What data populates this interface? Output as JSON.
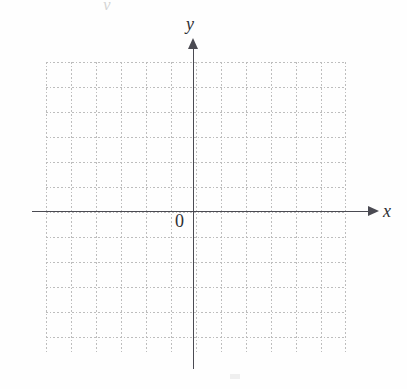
{
  "figure": {
    "type": "coordinate-grid",
    "background_color": "#fefefe",
    "axis_color": "#4a4a52",
    "grid_color": "#bdbdbd",
    "label_color": "#2e2e33"
  },
  "axes": {
    "x_label": "x",
    "y_label": "y",
    "origin_label": "0",
    "x_axis_name": "horizontal-axis",
    "y_axis_name": "vertical-axis",
    "x_arrow_direction": "right",
    "y_arrow_direction": "up"
  },
  "chart_data": {
    "type": "scatter",
    "title": "",
    "xlabel": "x",
    "ylabel": "y",
    "series": [],
    "x": [],
    "values": [],
    "xlim": [
      -6,
      6
    ],
    "ylim": [
      -5.6,
      6
    ],
    "grid": true,
    "grid_style": "dotted",
    "grid_spacing": 1,
    "legend": "none",
    "annotations": [
      {
        "text": "0",
        "x": -0.5,
        "y": -0.5,
        "role": "origin-label"
      },
      {
        "text": "x",
        "x": 6.9,
        "y": 0.4,
        "role": "axis-label"
      },
      {
        "text": "y",
        "x": -0.3,
        "y": 7.0,
        "role": "axis-label"
      }
    ]
  },
  "grid": {
    "columns": 12,
    "rows": 11.6,
    "cell_px": 25,
    "left_px": 46,
    "top_px": 62,
    "width_px": 300,
    "height_px": 290
  },
  "artifact": {
    "glyph": "y",
    "note": "partial scanned glyph clipped at top edge"
  }
}
